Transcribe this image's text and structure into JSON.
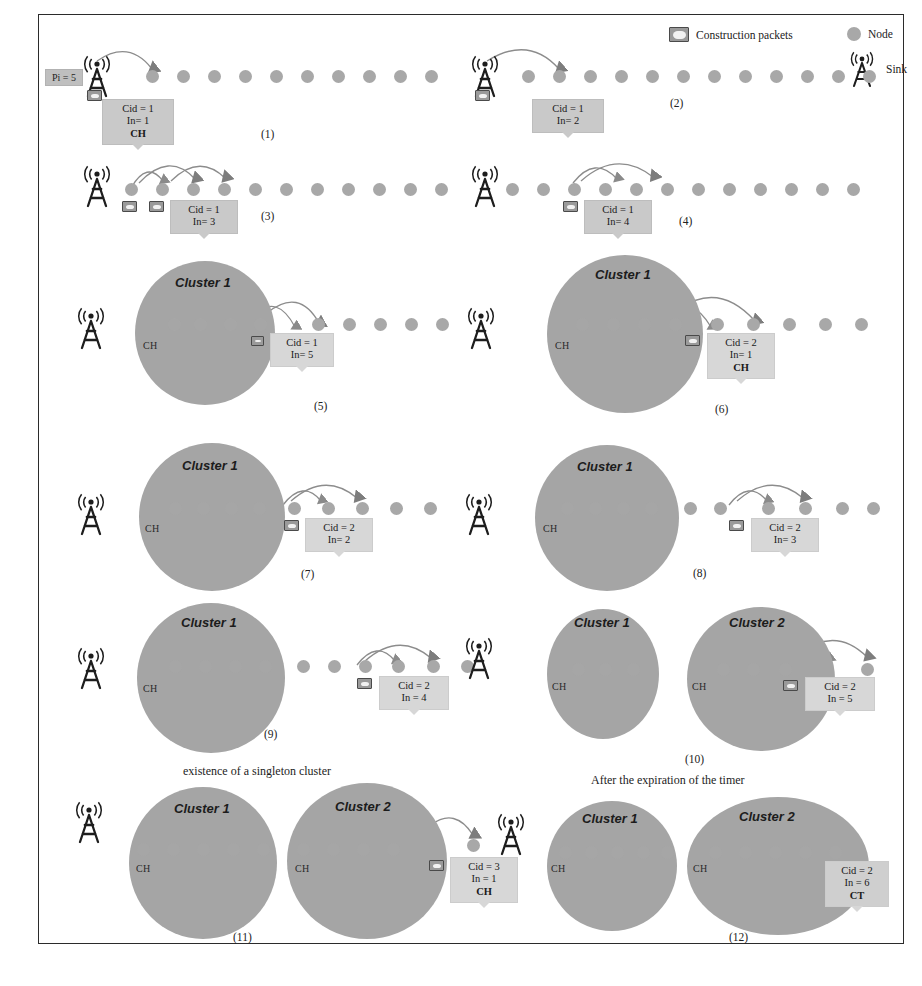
{
  "figure": {
    "type": "wireless-sensor-network-clustering-sequence",
    "panel_count": 12
  },
  "legend": {
    "packet_label": "Construction packets",
    "node_label": "Node",
    "sink_label": "Sink",
    "packet_icon": "envelope-packet-icon",
    "node_icon": "node-dot-icon",
    "sink_icon": "antenna-tower-icon"
  },
  "colors": {
    "node": "#a8a8a8",
    "cluster": "#a5a5a5",
    "infobox": "#c9c9c9",
    "packet_border": "#4a4a4a",
    "frame": "#2b2b2b",
    "arrow": "#6d6d6d"
  },
  "panels": [
    {
      "id": "1",
      "number": "(1)",
      "caption": "",
      "pi_tag": "Pi = 5",
      "info": {
        "cid": "Cid = 1",
        "in": "In= 1",
        "role": "CH"
      },
      "clusters": [],
      "packets": 1,
      "node_count": 14
    },
    {
      "id": "2",
      "number": "(2)",
      "caption": "",
      "info": {
        "cid": "Cid = 1",
        "in": "In= 2",
        "role": ""
      },
      "clusters": [],
      "packets": 1,
      "node_count": 14
    },
    {
      "id": "3",
      "number": "(3)",
      "caption": "",
      "info": {
        "cid": "Cid = 1",
        "in": "In= 3",
        "role": ""
      },
      "clusters": [],
      "packets": 2,
      "node_count": 14
    },
    {
      "id": "4",
      "number": "(4)",
      "caption": "",
      "info": {
        "cid": "Cid = 1",
        "in": "In= 4",
        "role": ""
      },
      "clusters": [],
      "packets": 1,
      "node_count": 14
    },
    {
      "id": "5",
      "number": "(5)",
      "caption": "",
      "info": {
        "cid": "Cid = 1",
        "in": "In= 5",
        "role": ""
      },
      "clusters": [
        {
          "title": "Cluster 1",
          "ch": "CH"
        }
      ],
      "packets": 1
    },
    {
      "id": "6",
      "number": "(6)",
      "caption": "",
      "info": {
        "cid": "Cid = 2",
        "in": "In= 1",
        "role": "CH"
      },
      "clusters": [
        {
          "title": "Cluster 1",
          "ch": "CH"
        }
      ],
      "packets": 1
    },
    {
      "id": "7",
      "number": "(7)",
      "caption": "",
      "info": {
        "cid": "Cid = 2",
        "in": "In= 2",
        "role": ""
      },
      "clusters": [
        {
          "title": "Cluster 1",
          "ch": "CH"
        }
      ],
      "packets": 1
    },
    {
      "id": "8",
      "number": "(8)",
      "caption": "",
      "info": {
        "cid": "Cid = 2",
        "in": "In= 3",
        "role": ""
      },
      "clusters": [
        {
          "title": "Cluster 1",
          "ch": "CH"
        }
      ],
      "packets": 1
    },
    {
      "id": "9",
      "number": "(9)",
      "caption": "",
      "info": {
        "cid": "Cid = 2",
        "in": "In = 4",
        "role": ""
      },
      "clusters": [
        {
          "title": "Cluster 1",
          "ch": "CH"
        }
      ],
      "packets": 1
    },
    {
      "id": "10",
      "number": "(10)",
      "caption": "",
      "info": {
        "cid": "Cid = 2",
        "in": "In = 5",
        "role": ""
      },
      "clusters": [
        {
          "title": "Cluster 1",
          "ch": "CH"
        },
        {
          "title": "Cluster 2",
          "ch": "CH"
        }
      ],
      "packets": 1
    },
    {
      "id": "11",
      "number": "(11)",
      "caption": "existence of a singleton cluster",
      "info": {
        "cid": "Cid = 3",
        "in": "In = 1",
        "role": "CH"
      },
      "clusters": [
        {
          "title": "Cluster 1",
          "ch": "CH"
        },
        {
          "title": "Cluster 2",
          "ch": "CH"
        }
      ],
      "packets": 1
    },
    {
      "id": "12",
      "number": "(12)",
      "caption": "After the expiration of the timer",
      "info": {
        "cid": "Cid = 2",
        "in": "In = 6",
        "role": "CT"
      },
      "clusters": [
        {
          "title": "Cluster 1",
          "ch": "CH"
        },
        {
          "title": "Cluster 2",
          "ch": "CH"
        }
      ],
      "packets": 0
    }
  ]
}
